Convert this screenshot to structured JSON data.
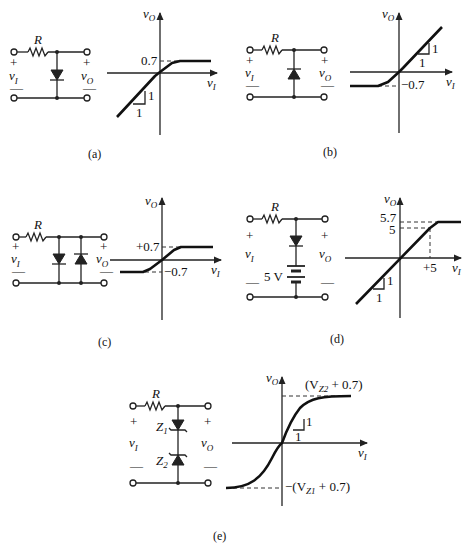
{
  "figure": {
    "panels": [
      {
        "id": "a",
        "caption": "(a)",
        "circuit": {
          "resistor_label": "R",
          "input_label": "v",
          "input_sub": "I",
          "output_label": "v",
          "output_sub": "O",
          "plus": "+",
          "minus": "—",
          "diodes": [
            "down"
          ]
        },
        "plot": {
          "y_axis": "v",
          "y_sub": "O",
          "x_axis": "v",
          "x_sub": "I",
          "annotations": [
            "0.7"
          ],
          "slope_labels": [
            "1",
            "1"
          ]
        }
      },
      {
        "id": "b",
        "caption": "(b)",
        "circuit": {
          "resistor_label": "R",
          "input_label": "v",
          "input_sub": "I",
          "output_label": "v",
          "output_sub": "O",
          "plus": "+",
          "minus": "—",
          "diodes": [
            "up"
          ]
        },
        "plot": {
          "y_axis": "v",
          "y_sub": "O",
          "x_axis": "v",
          "x_sub": "I",
          "annotations": [
            "−0.7"
          ],
          "slope_labels": [
            "1",
            "1"
          ]
        }
      },
      {
        "id": "c",
        "caption": "(c)",
        "circuit": {
          "resistor_label": "R",
          "input_label": "v",
          "input_sub": "I",
          "output_label": "v",
          "output_sub": "O",
          "plus": "+",
          "minus": "—",
          "diodes": [
            "down",
            "up"
          ]
        },
        "plot": {
          "y_axis": "v",
          "y_sub": "O",
          "x_axis": "v",
          "x_sub": "I",
          "annotations": [
            "+0.7",
            "−0.7"
          ]
        }
      },
      {
        "id": "d",
        "caption": "(d)",
        "circuit": {
          "resistor_label": "R",
          "input_label": "v",
          "input_sub": "I",
          "output_label": "v",
          "output_sub": "O",
          "plus": "+",
          "minus": "—",
          "diodes": [
            "down"
          ],
          "battery_label": "5 V"
        },
        "plot": {
          "y_axis": "v",
          "y_sub": "O",
          "x_axis": "v",
          "x_sub": "I",
          "annotations": [
            "5.7",
            "5",
            "+5"
          ],
          "slope_labels": [
            "1",
            "1"
          ]
        }
      },
      {
        "id": "e",
        "caption": "(e)",
        "circuit": {
          "resistor_label": "R",
          "input_label": "v",
          "input_sub": "I",
          "output_label": "v",
          "output_sub": "O",
          "plus": "+",
          "minus": "—",
          "zeners": [
            "Z",
            "Z"
          ],
          "zener_subs": [
            "1",
            "2"
          ]
        },
        "plot": {
          "y_axis": "v",
          "y_sub": "O",
          "x_axis": "v",
          "x_sub": "I",
          "annotations": [
            "(V",
            "Z2",
            " + 0.7)",
            "−(V",
            "Z1",
            " + 0.7)"
          ],
          "slope_labels": [
            "1",
            "1"
          ]
        }
      }
    ]
  }
}
